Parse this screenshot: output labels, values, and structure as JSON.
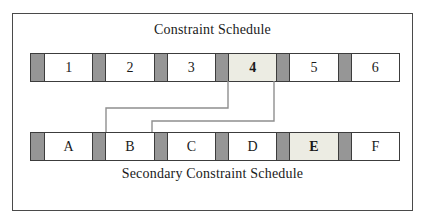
{
  "diagram": {
    "top_schedule": {
      "title": "Constraint Schedule",
      "slots": [
        {
          "label": "1",
          "highlighted": false
        },
        {
          "label": "2",
          "highlighted": false
        },
        {
          "label": "3",
          "highlighted": false
        },
        {
          "label": "4",
          "highlighted": true
        },
        {
          "label": "5",
          "highlighted": false
        },
        {
          "label": "6",
          "highlighted": false
        }
      ]
    },
    "bottom_schedule": {
      "title": "Secondary Constraint Schedule",
      "slots": [
        {
          "label": "A",
          "highlighted": false
        },
        {
          "label": "B",
          "highlighted": false
        },
        {
          "label": "C",
          "highlighted": false
        },
        {
          "label": "D",
          "highlighted": false
        },
        {
          "label": "E",
          "highlighted": true
        },
        {
          "label": "F",
          "highlighted": false
        }
      ]
    },
    "connections": [
      {
        "from": "4",
        "to": "B",
        "edges": [
          "left",
          "right"
        ]
      }
    ],
    "colors": {
      "separator_gray": "#969696",
      "highlight_fill": "#ecece3",
      "row_border": "#3c3c3c",
      "frame_border": "#4a4a4a",
      "connector_gray": "#8f8f8f",
      "text": "#1a1a1a",
      "background": "#ffffff"
    }
  }
}
